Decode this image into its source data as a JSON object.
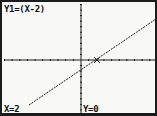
{
  "screen": {
    "equation_label": "Y1=(X-2)",
    "cursor_x_label": "X=2",
    "cursor_y_label": "Y=0"
  },
  "colors": {
    "background": "#f8f8f6",
    "ink": "#1c1c1c"
  },
  "chart_data": {
    "type": "line",
    "title": "Y1=(X-2)",
    "xlabel": "",
    "ylabel": "",
    "xlim": [
      -10,
      10
    ],
    "ylim": [
      -10,
      10
    ],
    "grid": false,
    "axes_ticks": {
      "x_step": 1,
      "y_step": 1
    },
    "series": [
      {
        "name": "Y1",
        "expression": "X-2",
        "x": [
          -6.5,
          9.5
        ],
        "y": [
          -8.5,
          7.5
        ]
      }
    ],
    "cursor": {
      "x": 2,
      "y": 0
    },
    "annotations": [
      "Y1=(X-2)",
      "X=2",
      "Y=0"
    ]
  }
}
